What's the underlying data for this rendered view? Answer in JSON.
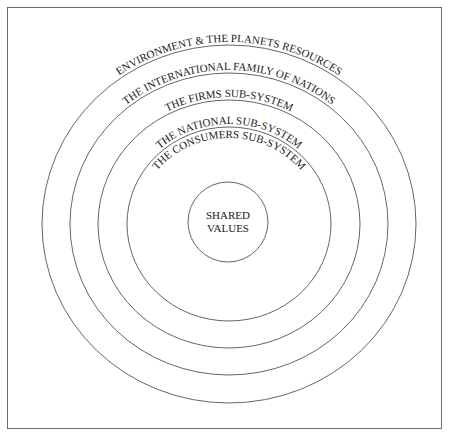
{
  "diagram": {
    "type": "concentric-circles",
    "center_label": {
      "line1": "SHARED",
      "line2": "VALUES"
    },
    "rings": [
      {
        "label": "THE CONSUMERS SUB-SYSTEM"
      },
      {
        "label": "THE NATIONAL SUB-SYSTEM"
      },
      {
        "label": "THE FIRMS SUB-SYSTEM"
      },
      {
        "label": "THE INTERNATIONAL FAMILY OF NATIONS"
      },
      {
        "label": "ENVIRONMENT & THE PLANETS RESOURCES"
      }
    ],
    "colors": {
      "line": "#555555",
      "text": "#1a1a1a",
      "background": "#ffffff"
    }
  }
}
